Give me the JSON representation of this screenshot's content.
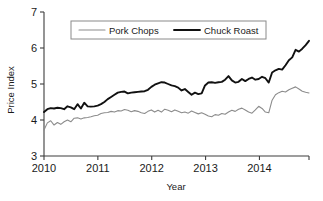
{
  "chart_data": {
    "type": "line",
    "title": "",
    "xlabel": "Year",
    "ylabel": "Price Index",
    "xlim": [
      2010.0,
      2014.92
    ],
    "ylim": [
      3,
      7
    ],
    "xticks": [
      "2010",
      "2011",
      "2012",
      "2013",
      "2014"
    ],
    "xtick_values": [
      2010,
      2011,
      2012,
      2013,
      2014
    ],
    "yticks": [
      "3",
      "4",
      "5",
      "6",
      "7"
    ],
    "ytick_values": [
      3,
      4,
      5,
      6,
      7
    ],
    "grid": false,
    "legend_position": "top-center",
    "series": [
      {
        "name": "Pork Chops",
        "color": "#8c8c8c",
        "width": 1.1,
        "values": [
          3.72,
          3.92,
          3.98,
          3.86,
          3.93,
          3.88,
          3.95,
          4.0,
          3.95,
          4.05,
          4.06,
          4.03,
          4.06,
          4.07,
          4.09,
          4.12,
          4.13,
          4.18,
          4.2,
          4.21,
          4.24,
          4.22,
          4.26,
          4.25,
          4.29,
          4.27,
          4.23,
          4.26,
          4.24,
          4.2,
          4.18,
          4.24,
          4.28,
          4.22,
          4.27,
          4.22,
          4.3,
          4.27,
          4.23,
          4.28,
          4.24,
          4.2,
          4.22,
          4.19,
          4.25,
          4.21,
          4.17,
          4.2,
          4.16,
          4.11,
          4.09,
          4.15,
          4.13,
          4.18,
          4.16,
          4.22,
          4.27,
          4.24,
          4.3,
          4.33,
          4.28,
          4.22,
          4.19,
          4.28,
          4.38,
          4.32,
          4.22,
          4.2,
          4.55,
          4.7,
          4.76,
          4.8,
          4.78,
          4.84,
          4.88,
          4.92,
          4.86,
          4.8,
          4.77,
          4.75
        ]
      },
      {
        "name": "Chuck Roast",
        "color": "#111111",
        "width": 1.9,
        "values": [
          4.22,
          4.3,
          4.33,
          4.32,
          4.34,
          4.33,
          4.3,
          4.38,
          4.35,
          4.3,
          4.44,
          4.32,
          4.48,
          4.38,
          4.37,
          4.38,
          4.4,
          4.44,
          4.5,
          4.58,
          4.64,
          4.7,
          4.76,
          4.78,
          4.79,
          4.74,
          4.76,
          4.77,
          4.78,
          4.79,
          4.8,
          4.84,
          4.92,
          4.98,
          5.02,
          5.05,
          5.04,
          5.0,
          4.96,
          4.94,
          4.9,
          4.82,
          4.86,
          4.78,
          4.7,
          4.76,
          4.72,
          4.74,
          4.96,
          5.04,
          5.05,
          5.03,
          5.05,
          5.06,
          5.12,
          5.22,
          5.1,
          5.04,
          5.06,
          5.14,
          5.08,
          5.14,
          5.18,
          5.12,
          5.14,
          5.2,
          5.16,
          5.04,
          5.32,
          5.38,
          5.42,
          5.4,
          5.52,
          5.66,
          5.74,
          5.95,
          5.9,
          5.98,
          6.08,
          6.2
        ]
      }
    ]
  },
  "axes": {
    "x_title": "Year",
    "y_title": "Price Index"
  },
  "legend": {
    "items": [
      {
        "label": "Pork Chops",
        "color": "#8c8c8c"
      },
      {
        "label": "Chuck Roast",
        "color": "#111111"
      }
    ]
  }
}
